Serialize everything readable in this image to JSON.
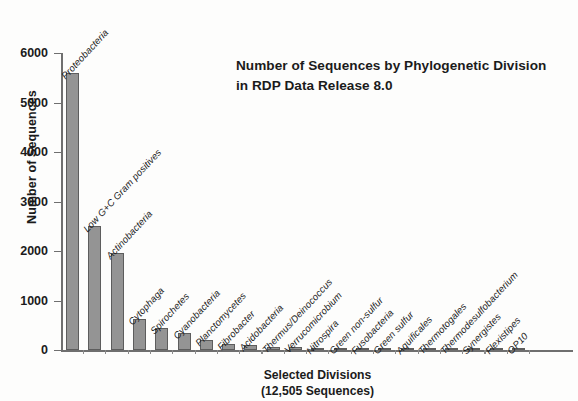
{
  "chart_data": {
    "type": "bar",
    "title": "Number of Sequences by Phylogenetic Division in RDP Data Release 8.0",
    "title_line1": "Number of Sequences by Phylogenetic",
    "title_line2": "Division in RDP Data Release 8.0",
    "xlabel": "Selected Divisions",
    "xlabel_line2": "(12,505 Sequences)",
    "ylabel": "Number of Sequences",
    "ylim": [
      0,
      6000
    ],
    "ytick_values": [
      0,
      1000,
      2000,
      3000,
      4000,
      5000,
      6000
    ],
    "ytick_labels": [
      "0",
      "1000",
      "2000",
      "3000",
      "4000",
      "5000",
      "6000"
    ],
    "grid": false,
    "legend": "none",
    "bar_color": "#949494",
    "bar_edge_color": "#5d5d5d",
    "axis_color": "#6f6f6f",
    "categories": [
      "Proteobacteria",
      "Low G+C Gram positives",
      "Actinobacteria",
      "Cytophaga",
      "Spirochetes",
      "Cyanobacteria",
      "Planctomycetes",
      "Fibrobacter",
      "Acidobacteria",
      "Thermus/Deinococcus",
      "Verrucomicrobium",
      "Nitrospira",
      "Green non-sulfur",
      "Fusobacteria",
      "Green sulfur",
      "Aquificales",
      "Thermotogales",
      "Thermodesulfobacterium",
      "Synergistes",
      "Flexistipes",
      "OP10"
    ],
    "values": [
      5600,
      2500,
      1950,
      620,
      440,
      350,
      200,
      130,
      110,
      60,
      55,
      45,
      35,
      30,
      28,
      25,
      22,
      20,
      18,
      16,
      14
    ]
  }
}
